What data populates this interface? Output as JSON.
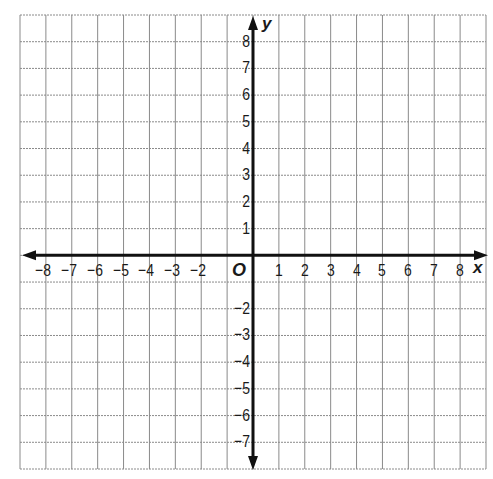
{
  "diagram": {
    "type": "coordinate-plane",
    "grid": {
      "columns": 18,
      "rows": 17,
      "left": 20,
      "top": 15,
      "right": 486,
      "bottom": 469,
      "line_color": "#8a8a8a",
      "axis_color": "#111111"
    },
    "axes": {
      "x_label": "x",
      "y_label": "y",
      "origin_label": "O",
      "origin_px": {
        "x": 253,
        "y": 255
      },
      "unit_px": {
        "x": 25.9,
        "y": 26.7
      }
    },
    "x_ticks": [
      {
        "value": -8,
        "label": "−8"
      },
      {
        "value": -7,
        "label": "−7"
      },
      {
        "value": -6,
        "label": "−6"
      },
      {
        "value": -5,
        "label": "−5"
      },
      {
        "value": -4,
        "label": "−4"
      },
      {
        "value": -3,
        "label": "−3"
      },
      {
        "value": -2,
        "label": "−2"
      },
      {
        "value": 1,
        "label": "1"
      },
      {
        "value": 2,
        "label": "2"
      },
      {
        "value": 3,
        "label": "3"
      },
      {
        "value": 4,
        "label": "4"
      },
      {
        "value": 5,
        "label": "5"
      },
      {
        "value": 6,
        "label": "6"
      },
      {
        "value": 7,
        "label": "7"
      },
      {
        "value": 8,
        "label": "8"
      }
    ],
    "y_ticks": [
      {
        "value": 8,
        "label": "8"
      },
      {
        "value": 7,
        "label": "7"
      },
      {
        "value": 6,
        "label": "6"
      },
      {
        "value": 5,
        "label": "5"
      },
      {
        "value": 4,
        "label": "4"
      },
      {
        "value": 3,
        "label": "3"
      },
      {
        "value": 2,
        "label": "2"
      },
      {
        "value": 1,
        "label": "1"
      },
      {
        "value": -2,
        "label": "−2"
      },
      {
        "value": -3,
        "label": "−3"
      },
      {
        "value": -4,
        "label": "−4"
      },
      {
        "value": -5,
        "label": "−5"
      },
      {
        "value": -6,
        "label": "−6"
      },
      {
        "value": -7,
        "label": "−7"
      }
    ]
  }
}
